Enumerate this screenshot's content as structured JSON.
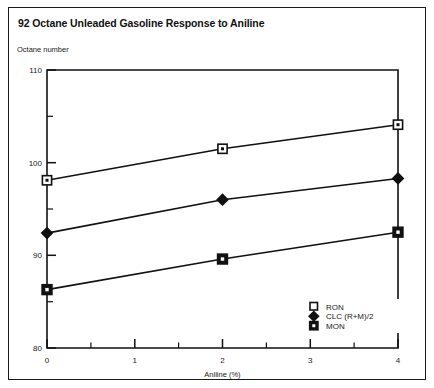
{
  "figure": {
    "title": "92 Octane Unleaded Gasoline Response to Aniline",
    "y_axis_caption": "Octane number"
  },
  "chart_data": {
    "type": "line",
    "title": "92 Octane Unleaded Gasoline Response to Aniline",
    "xlabel": "Aniline (%)",
    "ylabel": "Octane number",
    "xlim": [
      0,
      4
    ],
    "ylim": [
      80,
      110
    ],
    "x": [
      0,
      2,
      4
    ],
    "xticks": [
      0,
      1,
      2,
      3,
      4
    ],
    "xtick_labels": [
      "0",
      "1",
      "2",
      "3",
      "4"
    ],
    "x_minor_ticks": [
      0.5,
      1.5,
      2.5,
      3.5
    ],
    "yticks": [
      80,
      90,
      100,
      110
    ],
    "ytick_labels": [
      "80",
      "90",
      "100",
      "110"
    ],
    "y_minor_ticks": [
      85,
      95,
      105
    ],
    "grid": false,
    "legend_position": "lower right inside axes",
    "series": [
      {
        "name": "RON",
        "marker": "open-square",
        "values": [
          98.1,
          101.5,
          104.1
        ]
      },
      {
        "name": "CLC (R+M)/2",
        "marker": "filled-diamond",
        "values": [
          92.4,
          96.0,
          98.3
        ]
      },
      {
        "name": "MON",
        "marker": "filled-square-dot",
        "values": [
          86.3,
          89.6,
          92.5
        ]
      }
    ]
  },
  "legend": {
    "entries": [
      {
        "label": "RON"
      },
      {
        "label": "CLC (R+M)/2"
      },
      {
        "label": "MON"
      }
    ]
  },
  "axes": {
    "x_title": "Aniline (%)",
    "x_labels": [
      "0",
      "1",
      "2",
      "3",
      "4"
    ],
    "y_labels": [
      "110",
      "100",
      "90",
      "80"
    ]
  },
  "colors": {
    "ink": "#111111",
    "paper": "#ffffff"
  }
}
